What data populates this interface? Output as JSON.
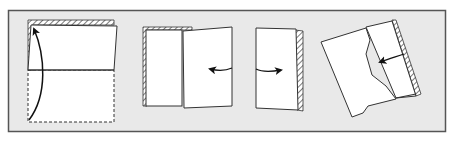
{
  "diagram": {
    "colors": {
      "background": "#ffffff",
      "frame_fill": "#e9e9e9",
      "frame_border": "#555555",
      "paper_fill": "#ffffff",
      "line": "#222222",
      "hatch": "#333333"
    },
    "steps": [
      {
        "id": 1,
        "description": "Fold bottom half up to top (valley fold along horizontal midline)",
        "arrow": "curved-up"
      },
      {
        "id": 2,
        "description": "Fold right half over to the left",
        "arrow": "left"
      },
      {
        "id": 3,
        "description": "Unfold / fold back to the right",
        "arrow": "right"
      },
      {
        "id": 4,
        "description": "Rotated sheet with stepped edge, fold toward left",
        "arrow": "left"
      }
    ]
  }
}
